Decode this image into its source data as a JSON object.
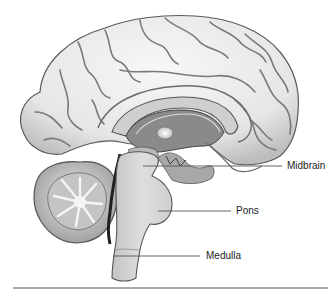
{
  "figure": {
    "labels": [
      {
        "id": "midbrain",
        "text": "Midbrain",
        "x": 287,
        "y": 160
      },
      {
        "id": "pons",
        "text": "Pons",
        "x": 236,
        "y": 205
      },
      {
        "id": "medulla",
        "text": "Medulla",
        "x": 206,
        "y": 250
      }
    ],
    "colors": {
      "cortex_fill": "#eeeeee",
      "cortex_shade": "#c9c9c9",
      "sulcus": "#6e6e6e",
      "outline": "#555555",
      "inner_dark": "#8a8a8a",
      "brainstem": "#d6d6d6",
      "leader_line": "#555555",
      "rule": "#8c8c8c"
    }
  }
}
